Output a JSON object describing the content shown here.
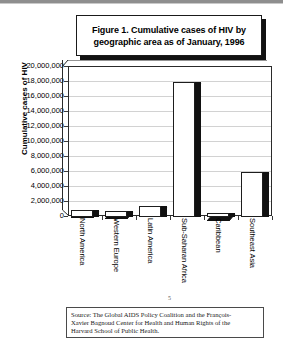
{
  "chart_data": {
    "type": "bar",
    "title": "Figure 1. Cumulative cases of HIV by geographic area as of January, 1996",
    "title_lines": [
      "Figure 1. Cumulative cases of HIV by",
      "geographic area as of January, 1996"
    ],
    "xlabel": "",
    "ylabel": "Cumulative cases of HIV",
    "ylim": [
      0,
      20000000
    ],
    "ytick_step": 2000000,
    "grid": true,
    "legend": "none",
    "style": "3d-column",
    "categories": [
      "North America",
      "Western Europe",
      "Latin America",
      "Sub-Saharan Africa",
      "Caribbean",
      "Southeast Asia"
    ],
    "values": [
      1000000,
      750000,
      1500000,
      18000000,
      500000,
      6000000
    ],
    "ytick_labels": [
      "20,000,000",
      "18,000,000",
      "16,000,000",
      "14,000,000",
      "12,000,000",
      "10,000,000",
      "8,000,000",
      "6,000,000",
      "4,000,000",
      "2,000,000",
      "0"
    ],
    "colors": {
      "bar_face": "#ffffff",
      "bar_shade": "#111111",
      "outline": "#1d1d1d",
      "gridline": "#d2d2d2"
    }
  },
  "source_note": {
    "lines": [
      "Source: The Global AIDS Policy Coalition and the François-",
      "Xavier Bagnoud Center for Health and Human Rights of the",
      "Harvard School of Public Health."
    ],
    "full": "Source: The Global AIDS Policy Coalition and the François-Xavier Bagnoud Center for Health and Human Rights of the Harvard School of Public Health."
  },
  "page_mark": "5"
}
